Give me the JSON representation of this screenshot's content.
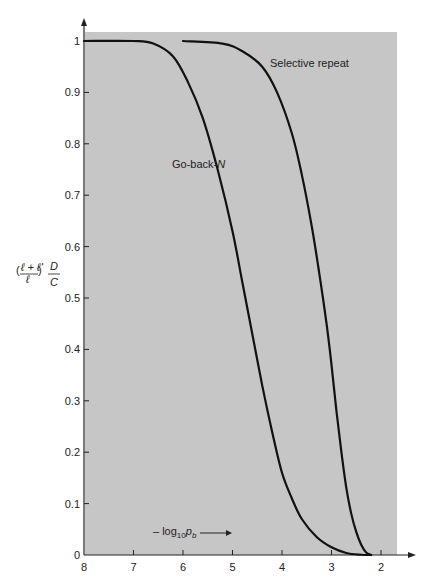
{
  "chart_data": {
    "type": "line",
    "title": "",
    "xlabel": "-log10 p_b",
    "ylabel": "((l + l')/l) D/C",
    "xlim": [
      8,
      2
    ],
    "ylim": [
      0,
      1
    ],
    "x_reversed": true,
    "grid": false,
    "x_ticks": [
      "8",
      "7",
      "6",
      "5",
      "4",
      "3",
      "2"
    ],
    "y_ticks": [
      "0",
      "0.1",
      "0.2",
      "0.3",
      "0.4",
      "0.5",
      "0.6",
      "0.7",
      "0.8",
      "0.9",
      "1"
    ],
    "series": [
      {
        "name": "Go-back-N",
        "x": [
          8,
          7.0,
          6.6,
          6.2,
          5.9,
          5.6,
          5.3,
          5.0,
          4.8,
          4.6,
          4.4,
          4.2,
          4.0,
          3.8,
          3.6,
          3.3,
          3.0,
          2.7,
          2.4,
          2.2
        ],
        "values": [
          1.0,
          1.0,
          0.995,
          0.97,
          0.92,
          0.85,
          0.75,
          0.63,
          0.53,
          0.43,
          0.33,
          0.24,
          0.16,
          0.11,
          0.07,
          0.035,
          0.015,
          0.004,
          0.0005,
          0.0
        ]
      },
      {
        "name": "Selective repeat",
        "x": [
          6.0,
          5.2,
          4.8,
          4.4,
          4.1,
          3.8,
          3.6,
          3.4,
          3.25,
          3.1,
          3.0,
          2.9,
          2.8,
          2.7,
          2.6,
          2.5,
          2.4,
          2.3,
          2.2
        ],
        "values": [
          1.0,
          0.995,
          0.98,
          0.95,
          0.9,
          0.82,
          0.74,
          0.64,
          0.55,
          0.45,
          0.37,
          0.28,
          0.2,
          0.13,
          0.08,
          0.045,
          0.02,
          0.005,
          0.0
        ]
      }
    ],
    "annotations": [
      {
        "text": "Selective repeat",
        "x": 3.7,
        "y": 0.96
      },
      {
        "text": "Go-back-N",
        "x": 5.9,
        "y": 0.76
      },
      {
        "text": "-log10 p_b →",
        "x": 6.5,
        "y": 0.03
      }
    ]
  },
  "labels": {
    "ylabel_prefix": "(",
    "ylabel_num": "ℓ + ℓ'",
    "ylabel_den": "ℓ",
    "ylabel_suffix": ")",
    "ylabel_D": "D",
    "ylabel_C": "C",
    "xlabel_text": "– log",
    "xlabel_sub": "10",
    "xlabel_p": "p",
    "xlabel_psub": "b",
    "go_back_n_main": "Go-back-",
    "go_back_n_N": "N",
    "selective_repeat": "Selective repeat"
  },
  "colors": {
    "plot_background": "#c6c6c6",
    "curve": "#111111",
    "axis": "#222222"
  }
}
